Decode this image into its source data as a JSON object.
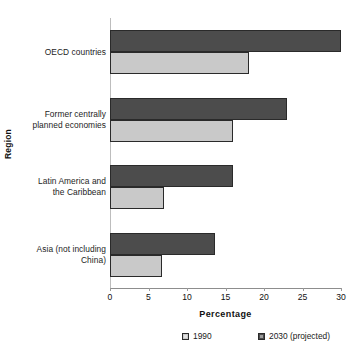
{
  "chart_data": {
    "type": "bar",
    "orientation": "horizontal",
    "title": "",
    "xlabel": "Percentage",
    "ylabel": "Region",
    "categories": [
      "OECD countries",
      "Former centrally planned economies",
      "Latin America and the Caribbean",
      "Asia (not including China)"
    ],
    "category_lines": [
      [
        "OECD countries"
      ],
      [
        "Former centrally",
        "planned economies"
      ],
      [
        "Latin America and",
        "the Caribbean"
      ],
      [
        "Asia (not including",
        "China)"
      ]
    ],
    "series": [
      {
        "name": "1990",
        "key": "base",
        "color": "#c9c9c9",
        "values": [
          18.0,
          16.0,
          7.0,
          6.7
        ]
      },
      {
        "name": "2030 (projected)",
        "key": "projected",
        "color": "#4c4c4c",
        "values": [
          30.0,
          23.0,
          16.0,
          13.6
        ]
      }
    ],
    "xlim": [
      0,
      30
    ],
    "xticks": [
      0,
      5,
      10,
      15,
      20,
      25,
      30
    ],
    "xtick_labels": [
      "0",
      "5",
      "10",
      "15",
      "20",
      "25",
      "30"
    ],
    "grid": false,
    "legend_position": "bottom"
  },
  "legend": {
    "entries": [
      {
        "label": "1990",
        "series_key": "base"
      },
      {
        "label": "2030 (projected)",
        "series_key": "projected"
      }
    ]
  },
  "colors": {
    "series_base": "#c9c9c9",
    "series_projected": "#4c4c4c",
    "bar_outline": "#2a2a2a",
    "axis": "#8d8d8d",
    "background": "#ffffff",
    "text": "#1a1a1a"
  }
}
